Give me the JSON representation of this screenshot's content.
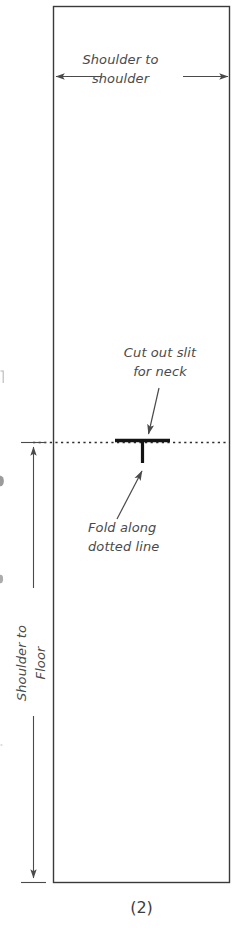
{
  "figure": {
    "caption": "(2)",
    "kind": "garment-pattern-diagram",
    "colors": {
      "outline": "#3a3a3a",
      "dimension_line": "#4a4a4a",
      "fold_line": "#2e2e2e",
      "slit": "#1a1a1a",
      "text": "#4a4a4a",
      "caption_text": "#3d3d3d",
      "background": "#ffffff"
    }
  },
  "labels": {
    "shoulder_to_shoulder": "Shoulder to\nshoulder",
    "cut_out_slit": "Cut out slit\nfor neck",
    "fold_along": "Fold along\ndotted line",
    "shoulder_to_floor": "Shoulder to\nFloor"
  },
  "measurements": [
    {
      "name": "shoulder-to-shoulder",
      "label": "Shoulder to shoulder",
      "orientation": "horizontal",
      "arrow_style": "double-headed"
    },
    {
      "name": "shoulder-to-floor",
      "label": "Shoulder to Floor",
      "orientation": "vertical",
      "arrow_style": "double-headed"
    }
  ],
  "features": [
    {
      "name": "neck-slit",
      "label": "Cut out slit for neck",
      "shape": "T-shaped slit"
    },
    {
      "name": "fold-line",
      "label": "Fold along dotted line",
      "shape": "horizontal dotted line"
    }
  ]
}
